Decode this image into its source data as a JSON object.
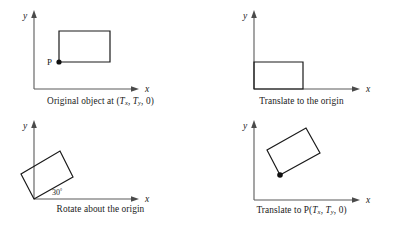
{
  "figure": {
    "background_color": "#ffffff",
    "stroke_color": "#1a1a1a",
    "axis_color": "#5a5a5a"
  },
  "panels": [
    {
      "id": "original",
      "caption_prefix": "Original object at (",
      "caption_tx": "T",
      "caption_tx_sub": "x",
      "caption_sep": ", ",
      "caption_ty": "T",
      "caption_ty_sub": "y",
      "caption_suffix": ", 0)",
      "x_axis_label": "x",
      "y_axis_label": "y",
      "point_label": "P",
      "shape": {
        "type": "rectangle",
        "points": "59,31 110,31 110,62 59,62",
        "rotation_deg": 0
      },
      "marker": {
        "cx": 59,
        "cy": 62,
        "r": 2.6
      }
    },
    {
      "id": "translate-origin",
      "caption_prefix": "Translate to the origin",
      "x_axis_label": "x",
      "y_axis_label": "y",
      "shape": {
        "type": "rectangle",
        "points": "53,62 102,62 102,89 53,89",
        "rotation_deg": 0
      }
    },
    {
      "id": "rotate-origin",
      "caption_prefix": "Rotate about the origin",
      "x_axis_label": "x",
      "y_axis_label": "y",
      "angle_label": "30",
      "angle_unit": "°",
      "shape": {
        "type": "rectangle",
        "points": "34,80 73,58 60,32 21,55",
        "rotation_deg": 30
      }
    },
    {
      "id": "translate-to-p",
      "caption_prefix": "Translate to P(",
      "caption_tx": "T",
      "caption_tx_sub": "x",
      "caption_sep": ", ",
      "caption_ty": "T",
      "caption_ty_sub": "y",
      "caption_suffix": ", 0)",
      "x_axis_label": "x",
      "y_axis_label": "y",
      "shape": {
        "type": "rectangle",
        "points": "79,56 119,34 105,9 66,31",
        "rotation_deg": 30
      },
      "marker": {
        "cx": 79,
        "cy": 56,
        "r": 2.8
      }
    }
  ]
}
